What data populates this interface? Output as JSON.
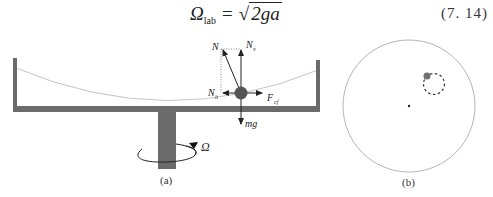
{
  "equation": {
    "lhs_symbol": "Ω",
    "lhs_subscript": "lab",
    "operator": "=",
    "radical_symbol": "√",
    "radicand": "2ga",
    "number": "(7. 14)"
  },
  "figure_a": {
    "caption": "(a)",
    "labels": {
      "normal_force": "N",
      "normal_vertical": "N",
      "normal_vertical_sub": "v",
      "normal_horizontal": "N",
      "normal_horizontal_sub": "h",
      "centrifugal_force": "F",
      "centrifugal_sub": "cf",
      "gravity": "mg",
      "rotation": "Ω"
    },
    "colors": {
      "container": "#6b6b6b",
      "ball": "#555555",
      "surface": "#bdbdbd"
    }
  },
  "figure_b": {
    "caption": "(b)",
    "colors": {
      "circle": "#b5b5b5",
      "ball": "#707070",
      "dashed_path": "#333333"
    }
  }
}
